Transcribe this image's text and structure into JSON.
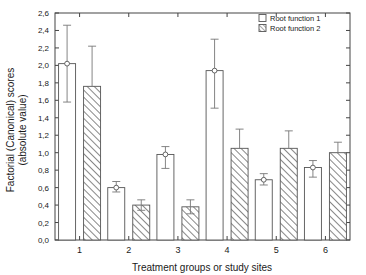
{
  "chart_data": {
    "type": "bar",
    "title": "",
    "xlabel": "Treatment groups or study sites",
    "ylabel_line1": "Factorial (Canonical) scores",
    "ylabel_line2": "(absolute value)",
    "categories": [
      "1",
      "2",
      "3",
      "4",
      "5",
      "6"
    ],
    "ylim": [
      0.0,
      2.6
    ],
    "ytick_labels": [
      "0,0",
      "0,2",
      "0,4",
      "0,6",
      "0,8",
      "1,0",
      "1,2",
      "1,4",
      "1,6",
      "1,8",
      "2,0",
      "2,2",
      "2,4",
      "2,6"
    ],
    "ytick_values": [
      0.0,
      0.2,
      0.4,
      0.6,
      0.8,
      1.0,
      1.2,
      1.4,
      1.6,
      1.8,
      2.0,
      2.2,
      2.4,
      2.6
    ],
    "grid": false,
    "legend_position": "top-right",
    "series": [
      {
        "name": "Root function 1",
        "style": "open",
        "values": [
          2.02,
          0.6,
          0.98,
          1.94,
          0.69,
          0.83
        ],
        "err_low": [
          1.58,
          0.55,
          0.82,
          1.51,
          0.63,
          0.72
        ],
        "err_high": [
          2.46,
          0.67,
          1.07,
          2.3,
          0.76,
          0.91
        ]
      },
      {
        "name": "Root function 2",
        "style": "hatched",
        "values": [
          1.76,
          0.4,
          0.38,
          1.05,
          1.05,
          1.0
        ],
        "err_low": [
          1.76,
          0.34,
          0.3,
          1.05,
          1.05,
          1.0
        ],
        "err_high": [
          2.22,
          0.46,
          0.46,
          1.27,
          1.25,
          1.12
        ]
      }
    ],
    "colors": {
      "axis": "#444444",
      "bar_stroke": "#555555",
      "bar_open_fill": "#ffffff",
      "hatch_stroke": "#555555",
      "error_bar": "#777777",
      "background": "#ffffff"
    }
  },
  "legend": {
    "items": [
      {
        "label": "Root function 1",
        "swatch": "open"
      },
      {
        "label": "Root function 2",
        "swatch": "hatched"
      }
    ]
  }
}
